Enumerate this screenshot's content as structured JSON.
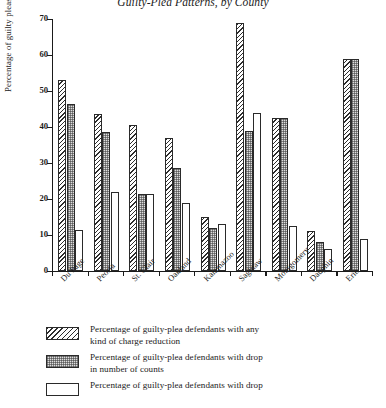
{
  "chart_data": {
    "type": "bar",
    "title": "Guilty-Plea Patterns, by County",
    "xlabel": "",
    "ylabel": "Percentage of guilty pleas",
    "ylim": [
      0,
      70
    ],
    "yticks": [
      0,
      10,
      20,
      30,
      40,
      50,
      60,
      70
    ],
    "grid": false,
    "legend_position": "below",
    "categories": [
      "Du Page",
      "Peoria",
      "St. Clair",
      "Oakland",
      "Kalamazoo",
      "Saginaw",
      "Montgomery",
      "Dauphin",
      "Erie"
    ],
    "series": [
      {
        "name": "Percentage of guilty-plea defendants with any\nkind of charge reduction",
        "fill": "diagonal-hatch",
        "values": [
          53,
          43.5,
          40.5,
          37,
          15,
          69,
          42.5,
          11,
          59
        ]
      },
      {
        "name": "Percentage of guilty-plea defendants with drop\nin number of counts",
        "fill": "stipple-gray",
        "values": [
          46.5,
          38.5,
          21.5,
          28.5,
          12,
          39,
          42.5,
          8,
          59
        ]
      },
      {
        "name": "Percentage of guilty-plea defendants with drop",
        "fill": "white",
        "values": [
          11.5,
          22,
          21.5,
          19,
          13,
          44,
          12.5,
          6,
          9
        ]
      }
    ]
  },
  "legend": {
    "items": [
      {
        "swatch": "diagonal-hatch-swatch",
        "label": "Percentage of guilty-plea defendants with any\nkind of charge reduction"
      },
      {
        "swatch": "stipple-gray-swatch",
        "label": "Percentage of guilty-plea defendants with drop\nin number of counts"
      },
      {
        "swatch": "white-swatch",
        "label": "Percentage of guilty-plea defendants with drop"
      }
    ]
  }
}
